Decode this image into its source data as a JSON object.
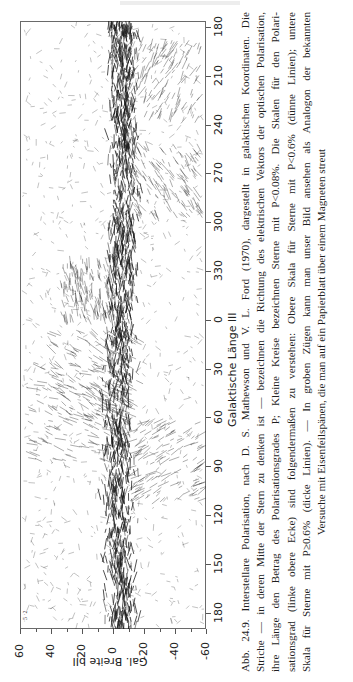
{
  "page": {
    "figure_number": "Abb. 24.9.",
    "caption_lines": [
      "Abb. 24.9. Interstellare Polarisation, nach D. S. Mathewson und V. L. Ford (1970), dargestellt in galaktischen Koordinaten. Die",
      "Striche — in deren Mitte der Stern zu denken ist — bezeichnen die Richtung des elektrischen Vektors der optischen Polarisation,",
      "ihre Länge den Betrag des Polarisationsgrades P; Kleine Kreise bezeichnen Sterne mit P<0.08%. Die Skalen für den Polari-",
      "sationsgrad (linke obere Ecke) sind folgendermaßen zu verstehen: Obere Skala für Sterne mit P<0.6% (dünne Linien); untere",
      "Skala für Sterne mit P≥0.6% (dicke Linien). — In groben Zügen kann man unser Bild ansehen als Analogon der bekannten",
      "Versuche mit Eisenfeilspänen, die man auf ein Papierblatt über einem Magneten streut"
    ]
  },
  "chart_data": {
    "type": "scatter",
    "orientation": "rotated 90° counter-clockwise on page",
    "xlabel": "Galaktische Länge lII",
    "ylabel": "Gal. Breite bII",
    "x_ticks": [
      180,
      210,
      240,
      270,
      300,
      330,
      0,
      30,
      60,
      90,
      120,
      150,
      180
    ],
    "y_ticks": [
      60,
      40,
      20,
      0,
      -20,
      -40,
      -60
    ],
    "xlim": [
      180,
      -180
    ],
    "ylim": [
      -60,
      60
    ],
    "grid": false,
    "legend": "scale keys in upper-left corner (thin lines P<0.6%, thick lines P≥0.6%)",
    "density_profile": [
      {
        "l": 180,
        "band_density": "high"
      },
      {
        "l": 210,
        "band_density": "high"
      },
      {
        "l": 240,
        "band_density": "medium"
      },
      {
        "l": 270,
        "band_density": "high"
      },
      {
        "l": 300,
        "band_density": "high"
      },
      {
        "l": 330,
        "band_density": "high"
      },
      {
        "l": 0,
        "band_density": "medium"
      },
      {
        "l": 30,
        "band_density": "high"
      },
      {
        "l": 60,
        "band_density": "medium"
      },
      {
        "l": 90,
        "band_density": "high"
      },
      {
        "l": 120,
        "band_density": "high"
      },
      {
        "l": 150,
        "band_density": "high"
      },
      {
        "l": 180,
        "band_density": "high"
      }
    ]
  },
  "axes": {
    "lon_title": "Galaktische Länge lII",
    "lat_title": "Gal. Breite bII",
    "lon_ticks": [
      "180",
      "210",
      "240",
      "270",
      "300",
      "330",
      "0",
      "30",
      "60",
      "90",
      "120",
      "150",
      "180"
    ],
    "lat_ticks": [
      "60",
      "40",
      "20",
      "0",
      "-20",
      "-40",
      "-60"
    ],
    "scale_key": "·5 ·2"
  },
  "colors": {
    "ink": "#1a1a1a",
    "frame": "#6a6a6a",
    "background": "#ffffff"
  }
}
